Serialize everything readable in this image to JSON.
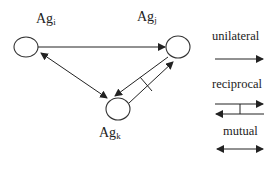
{
  "nodes": {
    "i": {
      "base": "Ag",
      "sub": "i"
    },
    "j": {
      "base": "Ag",
      "sub": "j"
    },
    "k": {
      "base": "Ag",
      "sub": "k"
    }
  },
  "edges": [
    {
      "from": "Ag_i",
      "to": "Ag_j",
      "type": "unilateral"
    },
    {
      "from": "Ag_i",
      "to": "Ag_k",
      "type": "mutual"
    },
    {
      "from": "Ag_k",
      "to": "Ag_j",
      "type": "reciprocal"
    }
  ],
  "legend": {
    "unilateral": "unilateral",
    "reciprocal": "reciprocal",
    "mutual": "mutual"
  },
  "colors": {
    "stroke": "#222222",
    "background": "#ffffff"
  }
}
